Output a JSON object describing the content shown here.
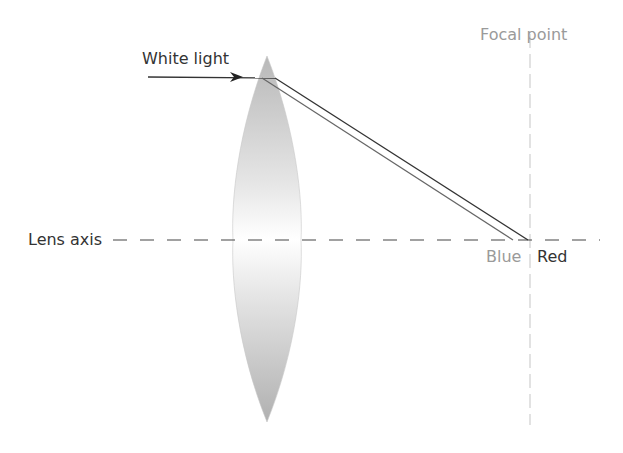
{
  "diagram": {
    "labels": {
      "white_light": "White light",
      "focal_point": "Focal point",
      "lens_axis": "Lens axis",
      "blue": "Blue",
      "red": "Red"
    },
    "colors": {
      "ray": "#333333",
      "blue_ray": "#555555",
      "lens_fill": "#bdbdbd",
      "axis": "#444444",
      "focal_line": "#cfcfcf",
      "light_text": "#9a9a9a",
      "dark_text": "#333333"
    }
  }
}
